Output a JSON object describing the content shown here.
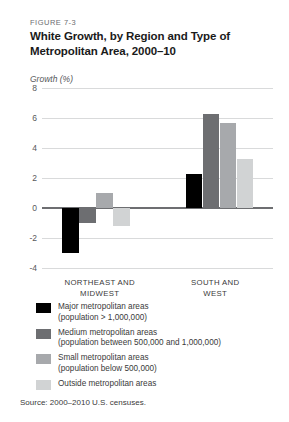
{
  "figure": {
    "number": "FIGURE 7-3",
    "title": "White Growth, by Region and Type of Metropolitan Area, 2000–10",
    "axis_title": "Growth (%)",
    "source": "Source: 2000–2010 U.S. censuses."
  },
  "legend": [
    {
      "color": "#000000",
      "line1": "Major metropolitan areas",
      "line2": "(population > 1,000,000)"
    },
    {
      "color": "#6d6e71",
      "line1": "Medium metropolitan areas",
      "line2": "(population between 500,000 and 1,000,000)"
    },
    {
      "color": "#a7a9ac",
      "line1": "Small metropolitan areas",
      "line2": "(population below 500,000)"
    },
    {
      "color": "#d1d3d4",
      "line1": "Outside metropolitan areas",
      "line2": ""
    }
  ],
  "chart_data": {
    "type": "bar",
    "title": "White Growth, by Region and Type of Metropolitan Area, 2000–10",
    "xlabel": "",
    "ylabel": "Growth (%)",
    "ylim": [
      -4,
      8
    ],
    "yticks": [
      8,
      6,
      4,
      2,
      0,
      -2,
      -4
    ],
    "ytick_labels": [
      "8",
      "6",
      "4",
      "2",
      "0",
      "-2",
      "-4"
    ],
    "grid": true,
    "legend_position": "below",
    "categories": [
      "NORTHEAST AND MIDWEST",
      "SOUTH AND WEST"
    ],
    "series": [
      {
        "name": "Major metropolitan areas (population > 1,000,000)",
        "color": "#000000",
        "values": [
          -3.0,
          2.3
        ]
      },
      {
        "name": "Medium metropolitan areas (population between 500,000 and 1,000,000)",
        "color": "#6d6e71",
        "values": [
          -1.0,
          6.3
        ]
      },
      {
        "name": "Small metropolitan areas (population below 500,000)",
        "color": "#a7a9ac",
        "values": [
          1.0,
          5.7
        ]
      },
      {
        "name": "Outside metropolitan areas",
        "color": "#d1d3d4",
        "values": [
          -1.2,
          3.3
        ]
      }
    ]
  }
}
